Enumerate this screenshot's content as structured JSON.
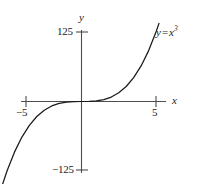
{
  "chart_data": {
    "type": "line",
    "title": "",
    "subtitle": "",
    "xlabel": "x",
    "ylabel": "y",
    "function": "y = x^3",
    "equation_label": {
      "lhs": "y",
      "operator": "=",
      "base": "x",
      "exponent": "3"
    },
    "xlim": [
      -5.6,
      5.6
    ],
    "ylim": [
      -155,
      155
    ],
    "xticks": [
      -5,
      5
    ],
    "xtick_labels": [
      "−5",
      "5"
    ],
    "yticks": [
      -125,
      125
    ],
    "ytick_labels": [
      "−125",
      "125"
    ],
    "grid": false,
    "legend": "none",
    "annotations": [
      {
        "text": "y = x³",
        "x": 5.3,
        "y": 140
      }
    ],
    "series": [
      {
        "name": "y = x^3",
        "color": "#1a1a1a",
        "x": [
          -5.35,
          -5.0,
          -4.5,
          -4.0,
          -3.5,
          -3.0,
          -2.5,
          -2.0,
          -1.5,
          -1.0,
          -0.5,
          0.0,
          0.5,
          1.0,
          1.5,
          2.0,
          2.5,
          3.0,
          3.5,
          4.0,
          4.5,
          5.0,
          5.2
        ],
        "y": [
          -153.1,
          -125.0,
          -91.1,
          -64.0,
          -42.9,
          -27.0,
          -15.6,
          -8.0,
          -3.4,
          -1.0,
          -0.1,
          0.0,
          0.1,
          1.0,
          3.4,
          8.0,
          15.6,
          27.0,
          42.9,
          64.0,
          91.1,
          125.0,
          140.6
        ]
      }
    ]
  },
  "axes": {
    "y_max_tick_label": "125",
    "y_min_tick_label": "−125",
    "x_min_tick_label": "−5",
    "x_max_tick_label": "5",
    "y_axis_name": "y",
    "x_axis_name": "x"
  },
  "colors": {
    "background": "#ffffff",
    "axis": "#4d4d4d",
    "curve": "#1a1a1a",
    "text": "#1a1a1a"
  }
}
